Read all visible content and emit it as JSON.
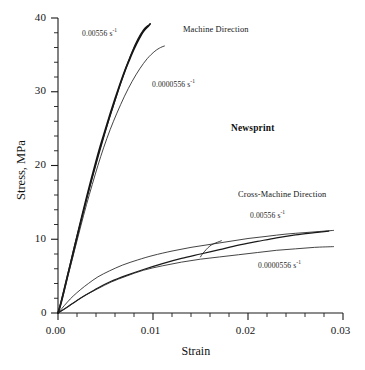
{
  "figure": {
    "corner_top_left": "",
    "corner_top_right": ""
  },
  "chart_data": {
    "type": "line",
    "title": "",
    "material_label": "Newsprint",
    "xlabel": "Strain",
    "ylabel": "Stress, MPa",
    "xlim": [
      0.0,
      0.03
    ],
    "ylim": [
      0,
      40
    ],
    "grid": false,
    "legend": "inline annotations",
    "x_ticks_major": [
      "0.00",
      "0.01",
      "0.02",
      "0.03"
    ],
    "x_ticks_major_values": [
      0.0,
      0.01,
      0.02,
      0.03
    ],
    "x_tick_minor_step": 0.002,
    "y_ticks_major": [
      "0",
      "10",
      "20",
      "30",
      "40"
    ],
    "y_ticks_major_values": [
      0,
      10,
      20,
      30,
      40
    ],
    "y_tick_minor_step": 2,
    "group_labels": {
      "machine": "Machine Direction",
      "cross_machine": "Cross-Machine Direction"
    },
    "rate_labels": {
      "fast": "0.00556 s",
      "slow": "0.0000556 s",
      "exponent": "-1"
    },
    "series": [
      {
        "name": "Machine Direction 0.00556 s^-1",
        "direction": "machine",
        "strain_rate": 0.00556,
        "style": "thick",
        "x": [
          0.0,
          0.0002,
          0.0005,
          0.001,
          0.0015,
          0.002,
          0.0025,
          0.003,
          0.0035,
          0.004,
          0.0045,
          0.005,
          0.0055,
          0.006,
          0.0065,
          0.007,
          0.0075,
          0.008,
          0.0085,
          0.009,
          0.0095,
          0.0097
        ],
        "y": [
          0.0,
          0.8,
          2.3,
          5.0,
          7.6,
          10.3,
          13.0,
          15.6,
          18.1,
          20.5,
          22.8,
          24.9,
          27.0,
          29.0,
          30.9,
          32.7,
          34.3,
          35.8,
          37.1,
          38.2,
          38.9,
          39.2
        ]
      },
      {
        "name": "Machine Direction 0.00556 s^-1 (replicate)",
        "direction": "machine",
        "strain_rate": 0.00556,
        "style": "medium",
        "x": [
          0.0,
          0.0003,
          0.0008,
          0.0013,
          0.0018,
          0.0024,
          0.003,
          0.0036,
          0.0042,
          0.0048,
          0.0054,
          0.006,
          0.0066,
          0.0072,
          0.0078,
          0.0084,
          0.009,
          0.0095
        ],
        "y": [
          0.0,
          1.4,
          4.0,
          6.7,
          9.4,
          12.4,
          15.4,
          18.3,
          21.1,
          23.8,
          26.4,
          28.8,
          31.2,
          33.4,
          35.4,
          37.1,
          38.4,
          39.0
        ]
      },
      {
        "name": "Machine Direction 0.0000556 s^-1",
        "direction": "machine",
        "strain_rate": 5.56e-05,
        "style": "thin",
        "x": [
          0.0,
          0.0003,
          0.0007,
          0.0012,
          0.0018,
          0.0024,
          0.003,
          0.0036,
          0.0042,
          0.0048,
          0.0055,
          0.0062,
          0.007,
          0.0078,
          0.0086,
          0.0094,
          0.0102,
          0.0108,
          0.0112
        ],
        "y": [
          0.0,
          1.2,
          3.2,
          5.8,
          8.8,
          11.8,
          14.7,
          17.4,
          20.0,
          22.4,
          24.9,
          27.1,
          29.4,
          31.4,
          33.1,
          34.5,
          35.5,
          36.0,
          36.2
        ]
      },
      {
        "name": "Cross-Machine Direction 0.00556 s^-1",
        "direction": "cross_machine",
        "strain_rate": 0.00556,
        "style": "thin",
        "x": [
          0.0,
          0.0004,
          0.001,
          0.0016,
          0.0024,
          0.0032,
          0.0042,
          0.0054,
          0.0068,
          0.0084,
          0.01,
          0.012,
          0.014,
          0.016,
          0.018,
          0.02,
          0.022,
          0.024,
          0.026,
          0.028,
          0.029
        ],
        "y": [
          0.0,
          0.6,
          1.5,
          2.3,
          3.2,
          4.0,
          4.9,
          5.7,
          6.5,
          7.2,
          7.8,
          8.4,
          8.9,
          9.3,
          9.7,
          10.1,
          10.4,
          10.7,
          10.9,
          11.1,
          11.2
        ]
      },
      {
        "name": "Cross-Machine Direction 0.00556 s^-1 (replicate)",
        "direction": "cross_machine",
        "strain_rate": 0.00556,
        "style": "medium",
        "x": [
          0.0,
          0.0005,
          0.0012,
          0.002,
          0.003,
          0.0042,
          0.0056,
          0.0072,
          0.009,
          0.011,
          0.013,
          0.015,
          0.017,
          0.019,
          0.021,
          0.023,
          0.025,
          0.027,
          0.0285
        ],
        "y": [
          0.0,
          0.4,
          1.0,
          1.7,
          2.5,
          3.4,
          4.3,
          5.1,
          5.9,
          6.7,
          7.4,
          8.0,
          8.6,
          9.2,
          9.7,
          10.2,
          10.6,
          10.9,
          11.1
        ]
      },
      {
        "name": "Cross-Machine Direction 0.0000556 s^-1",
        "direction": "cross_machine",
        "strain_rate": 5.56e-05,
        "style": "thin",
        "x": [
          0.0,
          0.0005,
          0.0012,
          0.002,
          0.003,
          0.0042,
          0.0056,
          0.0072,
          0.009,
          0.011,
          0.013,
          0.015,
          0.017,
          0.019,
          0.021,
          0.023,
          0.025,
          0.027,
          0.029
        ],
        "y": [
          0.0,
          0.4,
          1.0,
          1.7,
          2.5,
          3.3,
          4.2,
          5.0,
          5.8,
          6.4,
          6.9,
          7.3,
          7.6,
          7.9,
          8.2,
          8.5,
          8.7,
          8.9,
          9.0
        ]
      },
      {
        "name": "Cross-Machine Direction transition branch",
        "direction": "cross_machine",
        "strain_rate": 0.00556,
        "style": "thin",
        "x": [
          0.015,
          0.0152,
          0.0156,
          0.016,
          0.0164,
          0.0168,
          0.0172
        ],
        "y": [
          7.6,
          8.0,
          8.6,
          9.1,
          9.4,
          9.6,
          9.8
        ]
      }
    ]
  },
  "annotations": [
    {
      "id": "md-fast-rate",
      "text": "0.00556 s",
      "sup": "-1",
      "x_px": 82,
      "y_px": 29
    },
    {
      "id": "md-title",
      "text": "Machine Direction",
      "sup": "",
      "x_px": 183,
      "y_px": 25
    },
    {
      "id": "md-slow-rate",
      "text": "0.0000556 s",
      "sup": "-1",
      "x_px": 152,
      "y_px": 80
    },
    {
      "id": "material",
      "text": "Newsprint",
      "sup": "",
      "x_px": 231,
      "y_px": 123
    },
    {
      "id": "cmd-title",
      "text": "Cross-Machine Direction",
      "sup": "",
      "x_px": 238,
      "y_px": 190
    },
    {
      "id": "cmd-fast-rate",
      "text": "0.00556 s",
      "sup": "-1",
      "x_px": 250,
      "y_px": 211
    },
    {
      "id": "cmd-slow-rate",
      "text": "0.0000556 s",
      "sup": "-1",
      "x_px": 258,
      "y_px": 261
    }
  ]
}
